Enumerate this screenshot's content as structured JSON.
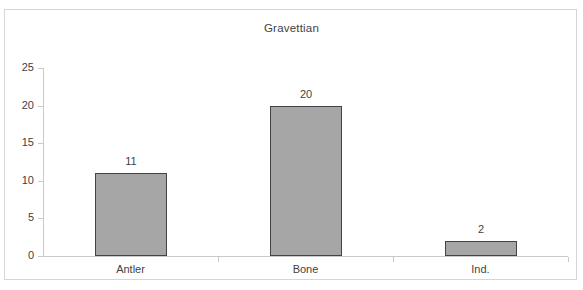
{
  "chart_data": {
    "type": "bar",
    "title": "Gravettian",
    "categories": [
      "Antler",
      "Bone",
      "Ind."
    ],
    "values": [
      11,
      20,
      2
    ],
    "data_labels": [
      "11",
      "20",
      "2"
    ],
    "xlabel": "",
    "ylabel": "",
    "ylim": [
      0,
      25
    ],
    "ytick_labels": [
      "0",
      "5",
      "10",
      "15",
      "20",
      "25"
    ],
    "ytick_values": [
      0,
      5,
      10,
      15,
      20,
      25
    ],
    "grid": false,
    "legend": null,
    "colors": {
      "bar_fill": "#a6a6a6",
      "bar_border": "#434343",
      "axis": "#c9c9c9",
      "text": "#3f3f3f",
      "frame": "#d6d6d6",
      "background": "#ffffff"
    }
  }
}
